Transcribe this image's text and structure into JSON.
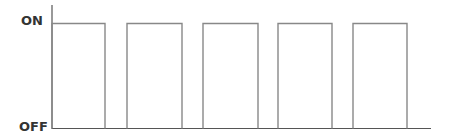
{
  "chart_data": {
    "type": "line",
    "subtype": "digital-square-wave",
    "title": "",
    "xlabel": "",
    "ylabel": "",
    "y_tick_labels": [
      "OFF",
      "ON"
    ],
    "y_levels": {
      "OFF": 0,
      "ON": 1
    },
    "grid": false,
    "legend": null,
    "series": [
      {
        "name": "signal",
        "pulses": [
          {
            "rise_x": 52,
            "fall_x": 105
          },
          {
            "rise_x": 127,
            "fall_x": 182
          },
          {
            "rise_x": 203,
            "fall_x": 258
          },
          {
            "rise_x": 278,
            "fall_x": 332
          },
          {
            "rise_x": 353,
            "fall_x": 407
          }
        ],
        "x": [
          0,
          1,
          2,
          3,
          4,
          5,
          6,
          7,
          8,
          9,
          10
        ],
        "values": [
          1,
          0,
          1,
          0,
          1,
          0,
          1,
          0,
          1,
          0,
          0
        ]
      }
    ],
    "colors": {
      "line": "#888888",
      "axis": "#555555",
      "label": "#333333"
    }
  },
  "labels": {
    "on": "ON",
    "off": "OFF"
  }
}
